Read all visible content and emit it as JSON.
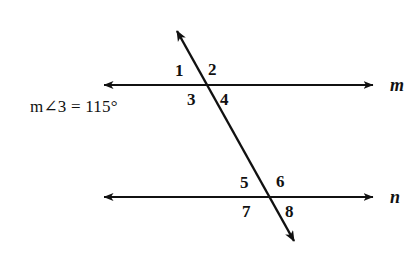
{
  "figure": {
    "background_color": "#ffffff",
    "stroke_color": "#111111",
    "given": {
      "text": "m∠3 = 115°",
      "measure_value": "115",
      "measure_unit": "°",
      "angle_referenced": "3"
    },
    "lines": [
      {
        "name": "line-m",
        "label": "m",
        "orientation": "horizontal",
        "y": 85,
        "x_start": 97,
        "x_end": 380,
        "arrow_start": true,
        "arrow_end": true,
        "label_x": 390,
        "label_y": 86
      },
      {
        "name": "line-n",
        "label": "n",
        "orientation": "horizontal",
        "y": 197,
        "x_start": 97,
        "x_end": 380,
        "arrow_start": true,
        "arrow_end": true,
        "label_x": 390,
        "label_y": 198
      },
      {
        "name": "transversal",
        "label": "",
        "orientation": "diagonal",
        "x_start": 172,
        "y_start": 22,
        "x_end": 299,
        "y_end": 250,
        "arrow_start": true,
        "arrow_end": true
      }
    ],
    "intersections": [
      {
        "name": "intersection-m",
        "x": 207,
        "y": 85
      },
      {
        "name": "intersection-n",
        "x": 272,
        "y": 197
      }
    ],
    "angle_labels": [
      {
        "id": "1",
        "text": "1",
        "x": 175,
        "y": 62,
        "position": "upper-left-of-m"
      },
      {
        "id": "2",
        "text": "2",
        "x": 208,
        "y": 61,
        "position": "upper-right-of-m"
      },
      {
        "id": "3",
        "text": "3",
        "x": 187,
        "y": 91,
        "position": "lower-left-of-m"
      },
      {
        "id": "4",
        "text": "4",
        "x": 220,
        "y": 91,
        "position": "lower-right-of-m"
      },
      {
        "id": "5",
        "text": "5",
        "x": 240,
        "y": 174,
        "position": "upper-left-of-n"
      },
      {
        "id": "6",
        "text": "6",
        "x": 276,
        "y": 173,
        "position": "upper-right-of-n"
      },
      {
        "id": "7",
        "text": "7",
        "x": 242,
        "y": 203,
        "position": "lower-left-of-n"
      },
      {
        "id": "8",
        "text": "8",
        "x": 285,
        "y": 203,
        "position": "lower-right-of-n"
      }
    ],
    "equation_position": {
      "x": 30,
      "y": 106
    }
  }
}
